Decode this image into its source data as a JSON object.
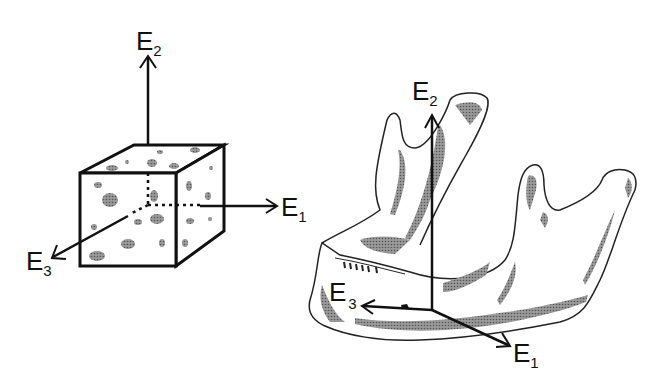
{
  "figure": {
    "left_panel": {
      "name": "bone specimen cube",
      "axes": [
        {
          "id": "E1",
          "letter": "E",
          "index": "1",
          "direction": "right"
        },
        {
          "id": "E2",
          "letter": "E",
          "index": "2",
          "direction": "up"
        },
        {
          "id": "E3",
          "letter": "E",
          "index": "3",
          "direction": "front-left"
        }
      ]
    },
    "right_panel": {
      "name": "mandible",
      "axes": [
        {
          "id": "E1",
          "letter": "E",
          "index": "1",
          "direction": "front-right-down"
        },
        {
          "id": "E2",
          "letter": "E",
          "index": "2",
          "direction": "up"
        },
        {
          "id": "E3",
          "letter": "E",
          "index": "3",
          "direction": "left"
        }
      ]
    },
    "colors": {
      "line": "#111111",
      "shade": "#7a7a7a",
      "background": "#ffffff"
    }
  }
}
